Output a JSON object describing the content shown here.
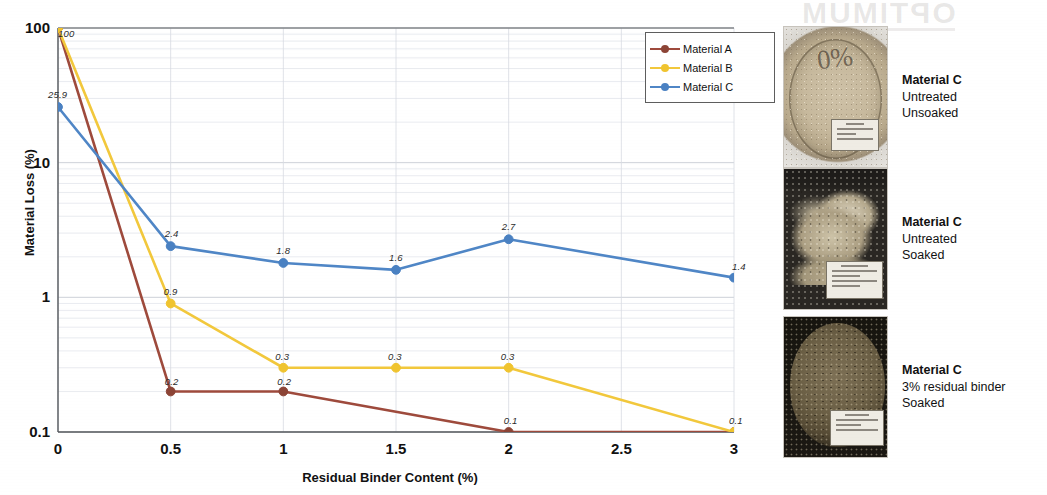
{
  "chart_data": {
    "type": "line",
    "title": "",
    "xlabel": "Residual Binder Content (%)",
    "ylabel": "Material Loss (%)",
    "yscale": "log",
    "ylim": [
      0.1,
      100
    ],
    "xlim": [
      0,
      3
    ],
    "grid": true,
    "legend_position": "top-right",
    "xticks": [
      "0",
      "0.5",
      "1",
      "1.5",
      "2",
      "2.5",
      "3"
    ],
    "yticks": [
      "100",
      "10",
      "1",
      "0.1"
    ],
    "x": [
      0,
      0.5,
      1,
      1.5,
      2,
      3
    ],
    "series": [
      {
        "name": "Material A",
        "color": "#9e4a3c",
        "marker_color": "#8c4436",
        "x": [
          0,
          0.5,
          1,
          2,
          3
        ],
        "values": [
          100,
          0.2,
          0.2,
          0.1,
          0.1
        ],
        "labels": [
          "100",
          "0.2",
          "0.2",
          "0.1",
          ""
        ]
      },
      {
        "name": "Material B",
        "color": "#f2c83c",
        "marker_color": "#f0c42f",
        "x": [
          0,
          0.5,
          1,
          1.5,
          2,
          3
        ],
        "values": [
          100,
          0.9,
          0.3,
          0.3,
          0.3,
          0.1
        ],
        "labels": [
          "100",
          "0.9",
          "0.3",
          "0.3",
          "0.3",
          "0.1"
        ]
      },
      {
        "name": "Material C",
        "color": "#4f86c6",
        "marker_color": "#4a81c2",
        "x": [
          0,
          0.5,
          1,
          1.5,
          2,
          3
        ],
        "values": [
          25.9,
          2.4,
          1.8,
          1.6,
          2.7,
          1.4
        ],
        "labels": [
          "25.9",
          "2.4",
          "1.8",
          "1.6",
          "2.7",
          "1.4"
        ]
      }
    ]
  },
  "legend": {
    "entries": [
      {
        "label": "Material A",
        "color": "#9e4a3c"
      },
      {
        "label": "Material B",
        "color": "#f2c83c"
      },
      {
        "label": "Material C",
        "color": "#4f86c6"
      }
    ]
  },
  "photos": [
    {
      "name": "material-c-untreated-unsoaked",
      "title": "Material C",
      "line2": "Untreated",
      "line3": "Unsoaked",
      "specimen_marking": "0%"
    },
    {
      "name": "material-c-untreated-soaked",
      "title": "Material C",
      "line2": "Untreated",
      "line3": "Soaked",
      "specimen_marking": ""
    },
    {
      "name": "material-c-3pct-binder-soaked",
      "title": "Material C",
      "line2": "3% residual binder",
      "line3": "Soaked",
      "specimen_marking": ""
    }
  ],
  "scan_artifacts": {
    "bleed_text": "OPTIMUM"
  }
}
